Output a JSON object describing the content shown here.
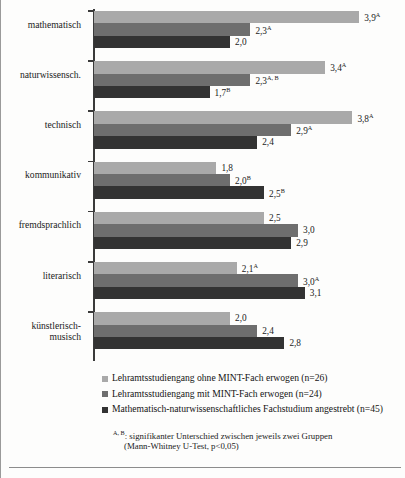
{
  "chart_data": {
    "type": "bar",
    "orientation": "horizontal",
    "title": "",
    "xlabel": "",
    "ylabel": "",
    "xlim": [
      0,
      4
    ],
    "grid": false,
    "legend_position": "bottom",
    "categories": [
      "mathematisch",
      "naturwissensch.",
      "technisch",
      "kommunikativ",
      "fremdsprachlich",
      "literarisch",
      "künstlerisch-musisch"
    ],
    "series": [
      {
        "name": "Lehramtsstudiengang ohne MINT-Fach erwogen (n=26)",
        "color": "#a9a9a9",
        "values": [
          3.9,
          3.4,
          3.8,
          1.8,
          2.5,
          2.1,
          2.0
        ],
        "labels": [
          "3,9",
          "3,4",
          "3,8",
          "1,8",
          "2,5",
          "2,1",
          "2,0"
        ],
        "marks": [
          "A",
          "A",
          "A",
          "",
          "",
          "A",
          ""
        ]
      },
      {
        "name": "Lehramtsstudiengang mit MINT-Fach erwogen (n=24)",
        "color": "#6e6e6e",
        "values": [
          2.3,
          2.3,
          2.9,
          2.0,
          3.0,
          3.0,
          2.4
        ],
        "labels": [
          "2,3",
          "2,3",
          "2,9",
          "2,0",
          "3,0",
          "3,0",
          "2,4"
        ],
        "marks": [
          "A",
          "A, B",
          "A",
          "B",
          "",
          "A",
          ""
        ]
      },
      {
        "name": "Mathematisch-naturwissenschaftliches Fachstudium angestrebt (n=45)",
        "color": "#333333",
        "values": [
          2.0,
          1.7,
          2.4,
          2.5,
          2.9,
          3.1,
          2.8
        ],
        "labels": [
          "2,0",
          "1,7",
          "2,4",
          "2,5",
          "2,9",
          "3,1",
          "2,8"
        ],
        "marks": [
          "",
          "B",
          "",
          "B",
          "",
          "",
          ""
        ]
      }
    ]
  },
  "legend": {
    "items": [
      {
        "label": "Lehramtsstudiengang ohne MINT-Fach erwogen (n=26)",
        "color": "#a9a9a9"
      },
      {
        "label": "Lehramtsstudiengang mit MINT-Fach erwogen (n=24)",
        "color": "#6e6e6e"
      },
      {
        "label": "Mathematisch-naturwissenschaftliches Fachstudium angestrebt (n=45)",
        "color": "#333333"
      }
    ]
  },
  "footnote": {
    "marks": "A, B",
    "line1": ": signifikanter Unterschied zwischen jeweils zwei Gruppen",
    "line2": "(Mann-Whitney U-Test, p<0,05)"
  }
}
